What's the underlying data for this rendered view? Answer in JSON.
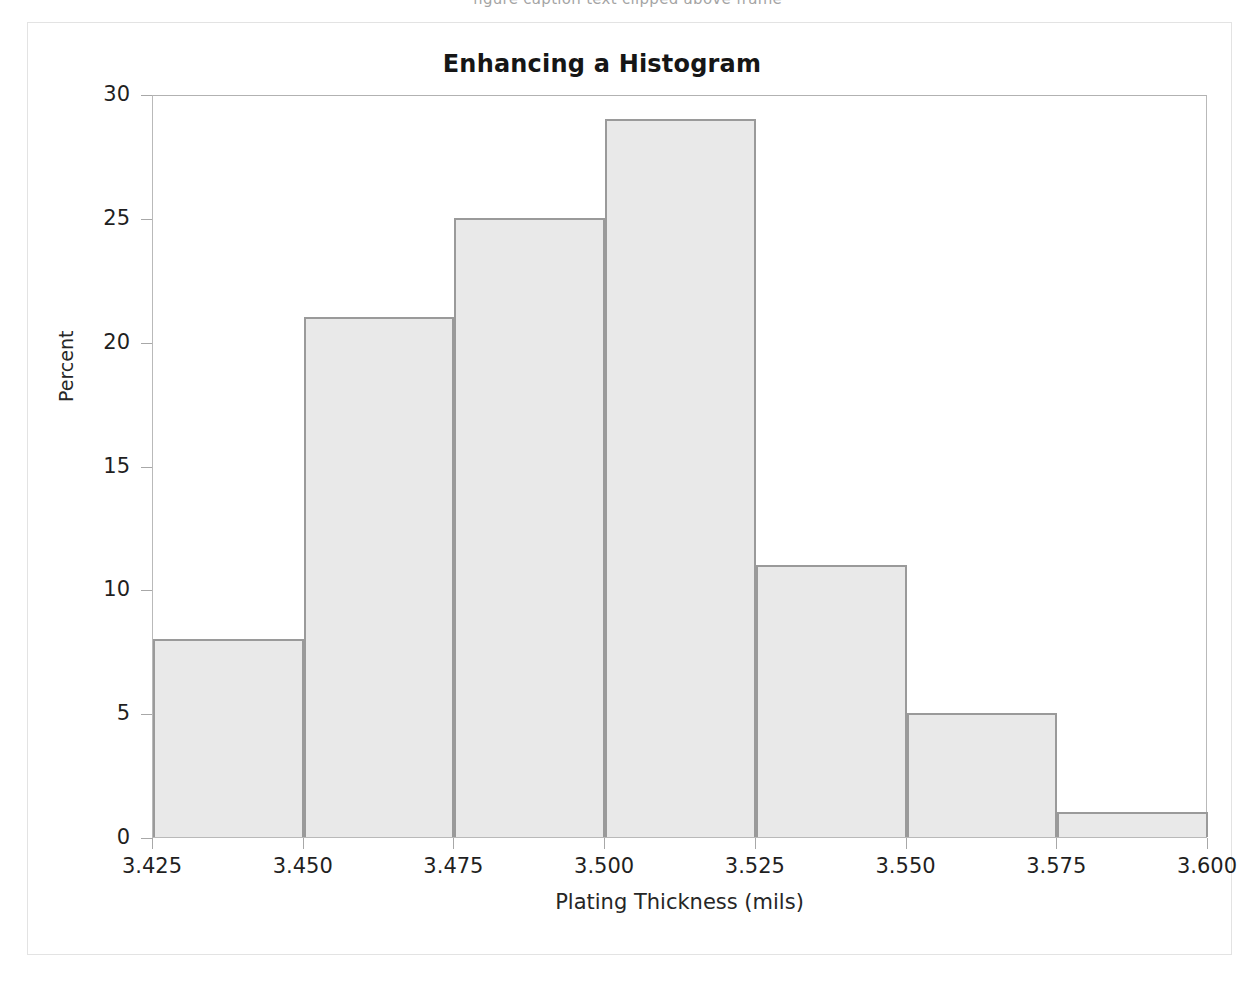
{
  "page": {
    "background": "#ffffff",
    "outer_border_color": "#e3e3e3",
    "clipped_top_text": "figure caption text clipped above frame"
  },
  "chart": {
    "title": "Enhancing a Histogram",
    "x_axis_title": "Plating Thickness (mils)",
    "y_axis_title": "Percent",
    "bar_fill": "#e9e9e9",
    "bar_border": "#9a9a9a",
    "frame_color": "#b9b9b9"
  },
  "chart_data": {
    "type": "bar",
    "title": "Enhancing a Histogram",
    "xlabel": "Plating Thickness (mils)",
    "ylabel": "Percent",
    "grid": false,
    "legend": "none",
    "xlim": [
      3.425,
      3.6
    ],
    "ylim": [
      0,
      30
    ],
    "xticks": [
      "3.425",
      "3.450",
      "3.475",
      "3.500",
      "3.525",
      "3.550",
      "3.575",
      "3.600"
    ],
    "xtick_values": [
      3.425,
      3.45,
      3.475,
      3.5,
      3.525,
      3.55,
      3.575,
      3.6
    ],
    "yticks": [
      "0",
      "5",
      "10",
      "15",
      "20",
      "25",
      "30"
    ],
    "ytick_values": [
      0,
      5,
      10,
      15,
      20,
      25,
      30
    ],
    "bin_width": 0.025,
    "bin_edges": [
      3.425,
      3.45,
      3.475,
      3.5,
      3.525,
      3.55,
      3.575,
      3.6
    ],
    "categories": [
      "3.425-3.450",
      "3.450-3.475",
      "3.475-3.500",
      "3.500-3.525",
      "3.525-3.550",
      "3.550-3.575",
      "3.575-3.600"
    ],
    "values": [
      8,
      21,
      25,
      29,
      11,
      5,
      1
    ]
  }
}
